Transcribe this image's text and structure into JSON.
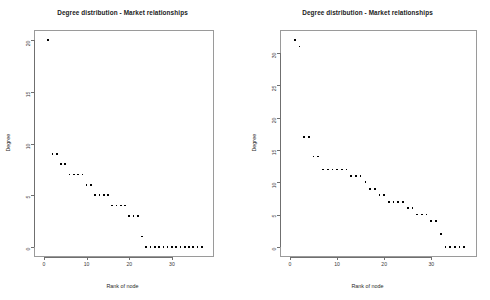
{
  "figure": {
    "background": "#ffffff",
    "point_color": "#000000",
    "frame_color": "#9a9a9a"
  },
  "panels": [
    {
      "id": "left",
      "title": "Degree distribution - Market relationships",
      "xlabel": "Rank of node",
      "ylabel": "Degree",
      "xticks": [
        "0",
        "10",
        "20",
        "30"
      ],
      "yticks": [
        "0",
        "5",
        "10",
        "15",
        "20"
      ]
    },
    {
      "id": "right",
      "title": "Degree distribution - Market relationships",
      "xlabel": "Rank of node",
      "ylabel": "Degree",
      "xticks": [
        "0",
        "10",
        "20",
        "30"
      ],
      "yticks": [
        "0",
        "5",
        "10",
        "15",
        "20",
        "25",
        "30"
      ]
    }
  ],
  "chart_data": [
    {
      "type": "scatter",
      "title": "Degree distribution - Market relationships",
      "xlabel": "Rank of node",
      "ylabel": "Degree",
      "xlim": [
        0,
        38
      ],
      "ylim": [
        0,
        20
      ],
      "xticks": [
        0,
        10,
        20,
        30
      ],
      "yticks": [
        0,
        5,
        10,
        15,
        20
      ],
      "grid": false,
      "legend": null,
      "marker": "filled-square",
      "x": [
        1,
        2,
        3,
        4,
        5,
        6,
        7,
        8,
        9,
        10,
        11,
        12,
        13,
        14,
        15,
        16,
        17,
        18,
        19,
        20,
        21,
        22,
        23,
        24,
        25,
        26,
        27,
        28,
        29,
        30,
        31,
        32,
        33,
        34,
        35,
        36,
        37
      ],
      "y": [
        20,
        9,
        9,
        8,
        8,
        7,
        7,
        7,
        7,
        6,
        6,
        5,
        5,
        5,
        5,
        4,
        4,
        4,
        4,
        3,
        3,
        3,
        1,
        0,
        0,
        0,
        0,
        0,
        0,
        0,
        0,
        0,
        0,
        0,
        0,
        0,
        0
      ]
    },
    {
      "type": "scatter",
      "title": "Degree distribution - Market relationships",
      "xlabel": "Rank of node",
      "ylabel": "Degree",
      "xlim": [
        0,
        38
      ],
      "ylim": [
        0,
        32
      ],
      "xticks": [
        0,
        10,
        20,
        30
      ],
      "yticks": [
        0,
        5,
        10,
        15,
        20,
        25,
        30
      ],
      "grid": false,
      "legend": null,
      "marker": "filled-square",
      "x": [
        1,
        2,
        3,
        4,
        5,
        6,
        7,
        8,
        9,
        10,
        11,
        12,
        13,
        14,
        15,
        16,
        17,
        18,
        19,
        20,
        21,
        22,
        23,
        24,
        25,
        26,
        27,
        28,
        29,
        30,
        31,
        32,
        33,
        34,
        35,
        36,
        37
      ],
      "y": [
        32,
        31,
        17,
        17,
        14,
        14,
        12,
        12,
        12,
        12,
        12,
        12,
        11,
        11,
        11,
        10,
        9,
        9,
        8,
        8,
        7,
        7,
        7,
        7,
        6,
        6,
        5,
        5,
        5,
        4,
        4,
        2,
        0,
        0,
        0,
        0,
        0
      ]
    }
  ]
}
